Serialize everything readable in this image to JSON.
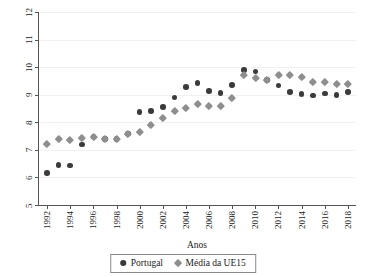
{
  "chart_data": {
    "type": "scatter",
    "title": "",
    "xlabel": "Anos",
    "ylabel": "Despesa de saúde em proporção do PIB",
    "xlim": [
      1991.3,
      2018.7
    ],
    "ylim": [
      5,
      12
    ],
    "ytick_labels": [
      "5",
      "6",
      "7",
      "8",
      "9",
      "10",
      "11",
      "12"
    ],
    "yticks": [
      5,
      6,
      7,
      8,
      9,
      10,
      11,
      12
    ],
    "xtick_labels": [
      "1992",
      "1994",
      "1996",
      "1998",
      "2000",
      "2002",
      "2004",
      "2006",
      "2008",
      "2010",
      "2012",
      "2014",
      "2016",
      "2018"
    ],
    "xticks": [
      1992,
      1994,
      1996,
      1998,
      2000,
      2002,
      2004,
      2006,
      2008,
      2010,
      2012,
      2014,
      2016,
      2018
    ],
    "grid": true,
    "legend_position": "bottom",
    "x": [
      1992,
      1993,
      1994,
      1995,
      1996,
      1997,
      1998,
      1999,
      2000,
      2001,
      2002,
      2003,
      2004,
      2005,
      2006,
      2007,
      2008,
      2009,
      2010,
      2011,
      2012,
      2013,
      2014,
      2015,
      2016,
      2017,
      2018
    ],
    "series": [
      {
        "name": "Portugal",
        "marker": "circle",
        "color": "#3b3b3b",
        "values": [
          6.17,
          6.46,
          6.43,
          7.19,
          7.48,
          7.4,
          7.4,
          7.6,
          8.37,
          8.4,
          8.55,
          8.9,
          9.29,
          9.42,
          9.14,
          9.06,
          9.35,
          9.9,
          9.84,
          9.54,
          9.34,
          9.09,
          9.02,
          8.97,
          9.04,
          8.99,
          9.1
        ]
      },
      {
        "name": "Média da UE15",
        "marker": "diamond",
        "color": "#8e8e8e",
        "values": [
          7.22,
          7.39,
          7.35,
          7.42,
          7.48,
          7.4,
          7.4,
          7.6,
          7.64,
          7.9,
          8.16,
          8.43,
          8.52,
          8.67,
          8.6,
          8.58,
          8.9,
          9.71,
          9.6,
          9.55,
          9.71,
          9.72,
          9.66,
          9.47,
          9.47,
          9.4,
          9.38
        ]
      }
    ]
  },
  "legend": {
    "entries": [
      {
        "label": "Portugal"
      },
      {
        "label": "Média da UE15"
      }
    ]
  }
}
